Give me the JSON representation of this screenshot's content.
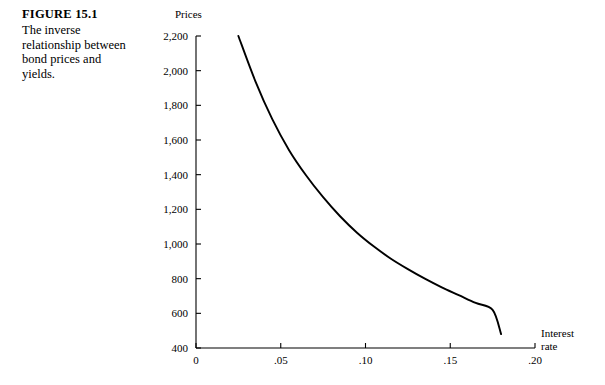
{
  "figure": {
    "number_label": "FIGURE 15.1",
    "caption_lines": [
      "The inverse",
      "relationship between",
      "bond prices and",
      "yields."
    ]
  },
  "chart_data": {
    "type": "line",
    "title": "",
    "xlabel": "Interest rate",
    "ylabel": "Prices",
    "xlabel_lines": [
      "Interest",
      "rate"
    ],
    "xlim": [
      0,
      0.2
    ],
    "ylim": [
      400,
      2200
    ],
    "grid": false,
    "legend": null,
    "x_ticks": [
      0,
      0.05,
      0.1,
      0.15,
      0.2
    ],
    "x_tick_labels": [
      "0",
      ".05",
      ".10",
      ".15",
      ".20"
    ],
    "y_ticks": [
      400,
      600,
      800,
      1000,
      1200,
      1400,
      1600,
      1800,
      2000,
      2200
    ],
    "y_tick_labels": [
      "400",
      "600",
      "800",
      "1,000",
      "1,200",
      "1,400",
      "1,600",
      "1,800",
      "2,000",
      "2,200"
    ],
    "series": [
      {
        "name": "Bond price vs. yield",
        "color": "#000000",
        "x": [
          0.025,
          0.035,
          0.045,
          0.055,
          0.065,
          0.075,
          0.085,
          0.095,
          0.105,
          0.115,
          0.125,
          0.135,
          0.145,
          0.155,
          0.165,
          0.175,
          0.18
        ],
        "y": [
          2200,
          1940,
          1720,
          1540,
          1395,
          1270,
          1160,
          1065,
          985,
          915,
          855,
          800,
          750,
          705,
          660,
          620,
          480
        ]
      }
    ]
  },
  "colors": {
    "axis": "#000000",
    "curve": "#000000",
    "background": "#ffffff"
  }
}
